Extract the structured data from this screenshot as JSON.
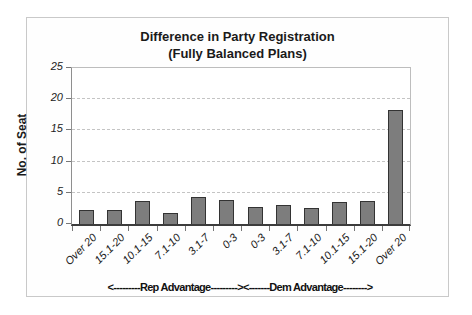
{
  "chart_data": {
    "type": "bar",
    "title": "Difference in Party Registration",
    "subtitle": "(Fully Balanced Plans)",
    "ylabel": "No. of Seat",
    "xlabel": "",
    "ylim": [
      0,
      25
    ],
    "yticks": [
      0,
      5,
      10,
      15,
      20,
      25
    ],
    "grid": "horizontal dashed at each y tick",
    "legend": "none",
    "categories": [
      "Over 20",
      "15.1-20",
      "10.1-15",
      "7.1-10",
      "3.1-7",
      "0-3",
      "0-3",
      "3.1-7",
      "7.1-10",
      "10.1-15",
      "15.1-20",
      "Over 20"
    ],
    "values": [
      2.3,
      2.2,
      3.7,
      1.7,
      4.3,
      3.9,
      2.7,
      3.0,
      2.5,
      3.6,
      3.7,
      18.3
    ],
    "x_group_labels": {
      "rep": "<---------Rep Advantage--------->",
      "dem": "<-------Dem Advantage-------->"
    },
    "colors": {
      "bar_fill": "#7d7d7d",
      "bar_border": "#333333",
      "gridline": "#c4c4c4",
      "axis": "#3c3c3c",
      "frame_border": "#c9c9c9",
      "background": "#ffffff"
    }
  }
}
